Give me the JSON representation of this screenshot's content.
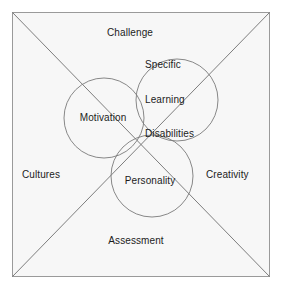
{
  "diagram": {
    "type": "venn-in-quadrant",
    "background_color": "#ffffff",
    "panel_color": "#f7f7f7",
    "stroke_color": "#8c8c8c",
    "text_color": "#1c1c1c",
    "frame": {
      "x": 12,
      "y": 12,
      "width": 258,
      "height": 265
    },
    "diagonals": [
      {
        "name": "diagonal-tl-br",
        "x1": 12,
        "y1": 12,
        "x2": 270,
        "y2": 277
      },
      {
        "name": "diagonal-tr-bl",
        "x1": 270,
        "y1": 12,
        "x2": 12,
        "y2": 277
      }
    ],
    "intersection_point": {
      "x": 141,
      "y": 144
    }
  },
  "edge_labels": {
    "top": {
      "text": "Challenge",
      "x": 130,
      "y": 33
    },
    "left": {
      "text": "Cultures",
      "x": 22,
      "y": 175
    },
    "right": {
      "text": "Creativity",
      "x": 206,
      "y": 175
    },
    "bottom": {
      "text": "Assessment",
      "x": 136,
      "y": 241
    }
  },
  "circles": [
    {
      "id": "motivation",
      "label": "Motivation",
      "cx": 104,
      "cy": 118,
      "r": 40,
      "label_x": 103,
      "label_y": 118,
      "label_lines": [
        "Motivation"
      ]
    },
    {
      "id": "specific-learning-disabilities",
      "label": "Specific Learning Disabilities",
      "cx": 177,
      "cy": 100,
      "r": 41,
      "label_x": 145,
      "label_y": 99,
      "label_lines": [
        "Specific",
        "Learning",
        "Disabilities"
      ]
    },
    {
      "id": "personality",
      "label": "Personality",
      "cx": 152,
      "cy": 176,
      "r": 41,
      "label_x": 150,
      "label_y": 181,
      "label_lines": [
        "Personality"
      ]
    }
  ]
}
